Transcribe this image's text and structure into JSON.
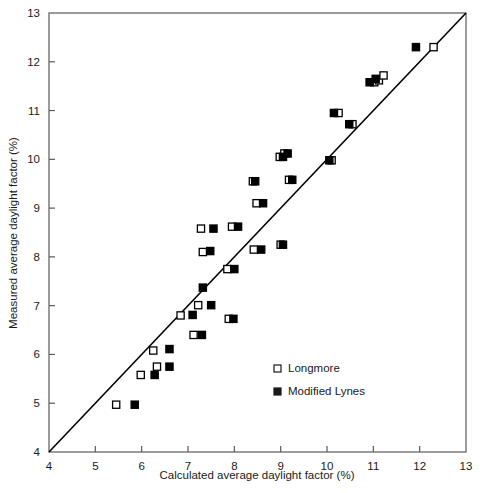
{
  "chart_data": {
    "type": "scatter",
    "title": "",
    "xlabel": "Calculated average daylight factor (%)",
    "ylabel": "Measured average daylight factor (%)",
    "xlim": [
      4,
      13
    ],
    "ylim": [
      4,
      13
    ],
    "xticks": [
      4,
      5,
      6,
      7,
      8,
      9,
      10,
      11,
      12,
      13
    ],
    "yticks": [
      4,
      5,
      6,
      7,
      8,
      9,
      10,
      11,
      12,
      13
    ],
    "xtick_labels": [
      "4",
      "5",
      "6",
      "7",
      "8",
      "9",
      "10",
      "11",
      "12",
      "13"
    ],
    "ytick_labels": [
      "4",
      "5",
      "6",
      "7",
      "8",
      "9",
      "10",
      "11",
      "12",
      "13"
    ],
    "grid": false,
    "legend_position": "lower right",
    "reference_line": {
      "name": "1:1 line",
      "x": [
        4,
        13
      ],
      "y": [
        4,
        13
      ],
      "color": "#000000",
      "width": 1.6
    },
    "series": [
      {
        "name": "Longmore",
        "marker": "open-square",
        "color": "#000000",
        "fill": "#ffffff",
        "points": [
          [
            5.45,
            4.97
          ],
          [
            5.98,
            5.58
          ],
          [
            6.33,
            5.75
          ],
          [
            6.25,
            6.08
          ],
          [
            7.12,
            6.4
          ],
          [
            7.22,
            7.01
          ],
          [
            6.84,
            6.8
          ],
          [
            7.88,
            6.73
          ],
          [
            7.32,
            8.1
          ],
          [
            7.28,
            8.58
          ],
          [
            7.95,
            8.62
          ],
          [
            7.85,
            7.75
          ],
          [
            8.42,
            8.15
          ],
          [
            8.48,
            9.1
          ],
          [
            8.4,
            9.55
          ],
          [
            9.0,
            8.25
          ],
          [
            8.98,
            10.05
          ],
          [
            9.08,
            10.12
          ],
          [
            9.18,
            9.58
          ],
          [
            10.1,
            9.98
          ],
          [
            10.25,
            10.95
          ],
          [
            10.55,
            10.72
          ],
          [
            11.02,
            11.58
          ],
          [
            11.12,
            11.62
          ],
          [
            11.22,
            11.72
          ],
          [
            12.3,
            12.3
          ]
        ]
      },
      {
        "name": "Modified Lynes",
        "marker": "filled-square",
        "color": "#000000",
        "fill": "#000000",
        "points": [
          [
            5.85,
            4.97
          ],
          [
            6.28,
            5.58
          ],
          [
            6.6,
            5.75
          ],
          [
            6.6,
            6.11
          ],
          [
            7.3,
            6.4
          ],
          [
            7.5,
            7.01
          ],
          [
            7.1,
            6.81
          ],
          [
            7.98,
            6.73
          ],
          [
            7.48,
            8.12
          ],
          [
            7.32,
            7.37
          ],
          [
            7.55,
            8.58
          ],
          [
            8.08,
            8.62
          ],
          [
            8.0,
            7.75
          ],
          [
            8.58,
            8.15
          ],
          [
            8.62,
            9.1
          ],
          [
            8.45,
            9.55
          ],
          [
            9.05,
            8.25
          ],
          [
            9.05,
            10.05
          ],
          [
            9.15,
            10.12
          ],
          [
            9.25,
            9.58
          ],
          [
            10.05,
            9.98
          ],
          [
            10.15,
            10.95
          ],
          [
            10.48,
            10.72
          ],
          [
            10.92,
            11.58
          ],
          [
            11.05,
            11.65
          ],
          [
            11.92,
            12.3
          ]
        ]
      }
    ]
  },
  "axes": {
    "x_title": "Calculated average daylight factor (%)",
    "y_title": "Measured average daylight factor (%)"
  },
  "legend": {
    "items": [
      {
        "label": "Longmore",
        "marker": "open-square"
      },
      {
        "label": "Modified Lynes",
        "marker": "filled-square"
      }
    ]
  }
}
